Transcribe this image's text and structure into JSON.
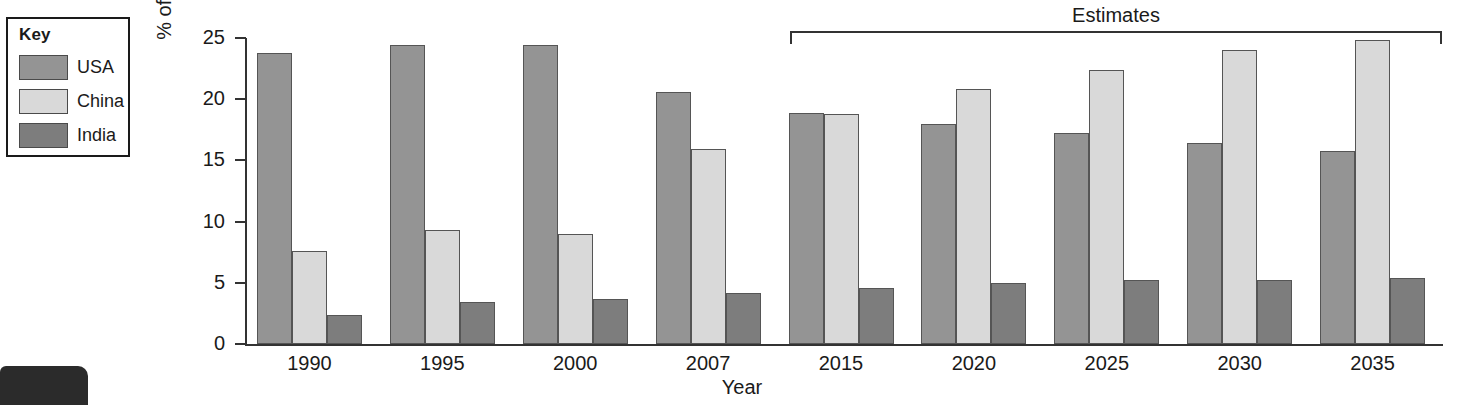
{
  "legend": {
    "title": "Key",
    "items": [
      {
        "label": "USA",
        "color": "#949494"
      },
      {
        "label": "China",
        "color": "#d9d9d9"
      },
      {
        "label": "India",
        "color": "#7d7d7d"
      }
    ]
  },
  "annotation": {
    "estimates_label": "Estimates",
    "estimates_start_category": "2015",
    "estimates_end_category": "2035"
  },
  "chart_data": {
    "type": "bar",
    "title": "",
    "xlabel": "Year",
    "ylabel": "% of world total energy\nconsumption",
    "categories": [
      "1990",
      "1995",
      "2000",
      "2007",
      "2015",
      "2020",
      "2025",
      "2030",
      "2035"
    ],
    "series": [
      {
        "name": "USA",
        "color": "#949494",
        "values": [
          23.8,
          24.4,
          24.4,
          20.6,
          18.9,
          18.0,
          17.2,
          16.4,
          15.8
        ]
      },
      {
        "name": "China",
        "color": "#d9d9d9",
        "values": [
          7.6,
          9.3,
          9.0,
          15.9,
          18.8,
          20.8,
          22.4,
          24.0,
          24.8
        ]
      },
      {
        "name": "India",
        "color": "#7d7d7d",
        "values": [
          2.4,
          3.4,
          3.7,
          4.2,
          4.6,
          5.0,
          5.2,
          5.2,
          5.4
        ]
      }
    ],
    "ylim": [
      0,
      25
    ],
    "yticks": [
      0,
      5,
      10,
      15,
      20,
      25
    ],
    "grid": false,
    "legend_position": "outside-top-left"
  }
}
